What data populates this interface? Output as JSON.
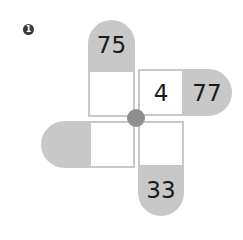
{
  "problem": {
    "number_badge": "1",
    "arms": {
      "top": {
        "outer_value": "75",
        "inner_value": ""
      },
      "right": {
        "inner_value": "4",
        "outer_value": "77"
      },
      "left": {
        "outer_value": "",
        "inner_value": ""
      },
      "bottom": {
        "inner_value": "",
        "outer_value": "33"
      }
    },
    "colors": {
      "pill_gray": "#c8c8c8",
      "center_dot": "#8f8f8f",
      "badge": "#3a3a3a"
    }
  }
}
